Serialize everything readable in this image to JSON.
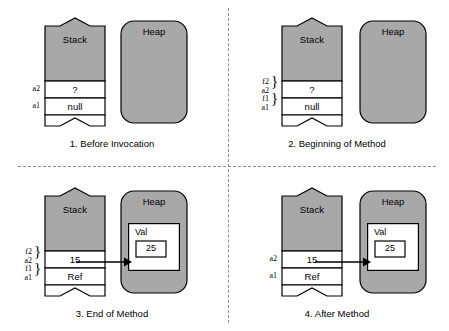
{
  "figure": {
    "colors": {
      "stack_fill": "#a8a8a8",
      "cell_fill": "#ffffff",
      "heap_fill": "#a8a8a8",
      "object_fill": "#ffffff",
      "stroke": "#000000",
      "divider": "#8c8c8c"
    }
  },
  "panels": [
    {
      "id": "panel-1",
      "caption": "1. Before Invocation",
      "stack": {
        "title": "Stack",
        "cells": [
          {
            "label": "a2",
            "value": "?"
          },
          {
            "label": "a1",
            "value": "null"
          },
          {
            "label": "",
            "value": ""
          }
        ]
      },
      "heap": {
        "title": "Heap",
        "object": null
      },
      "arrow": false
    },
    {
      "id": "panel-2",
      "caption": "2. Beginning of Method",
      "stack": {
        "title": "Stack",
        "cells": [
          {
            "label": "f2",
            "label2": "a2",
            "value": "?"
          },
          {
            "label": "f1",
            "label2": "a1",
            "value": "null"
          },
          {
            "label": "",
            "value": ""
          }
        ]
      },
      "heap": {
        "title": "Heap",
        "object": null
      },
      "arrow": false
    },
    {
      "id": "panel-3",
      "caption": "3. End of Method",
      "stack": {
        "title": "Stack",
        "cells": [
          {
            "label": "f2",
            "label2": "a2",
            "value": "15"
          },
          {
            "label": "f1",
            "label2": "a1",
            "value": "Ref"
          },
          {
            "label": "",
            "value": ""
          }
        ]
      },
      "heap": {
        "title": "Heap",
        "object": {
          "name": "Val",
          "field": "25"
        }
      },
      "arrow": true
    },
    {
      "id": "panel-4",
      "caption": "4. After Method",
      "stack": {
        "title": "Stack",
        "cells": [
          {
            "label": "a2",
            "value": "15"
          },
          {
            "label": "a1",
            "value": "Ref"
          },
          {
            "label": "",
            "value": ""
          }
        ]
      },
      "heap": {
        "title": "Heap",
        "object": {
          "name": "Val",
          "field": "25"
        }
      },
      "arrow": true
    }
  ]
}
